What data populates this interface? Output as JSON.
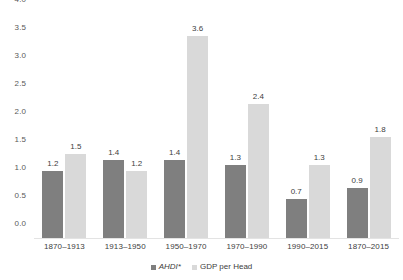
{
  "chart_data": {
    "type": "bar",
    "title": "",
    "subtitle": "",
    "xlabel": "",
    "ylabel": "",
    "ylim": [
      0.0,
      4.0
    ],
    "ytick_step": 0.5,
    "yticks": [
      "0.0",
      "0.5",
      "1.0",
      "1.5",
      "2.0",
      "2.5",
      "3.0",
      "3.5",
      "4.0"
    ],
    "grid": false,
    "legend_position": "bottom-center",
    "categories": [
      "1870–1913",
      "1913–1950",
      "1950–1970",
      "1970–1990",
      "1990–2015",
      "1870–2015"
    ],
    "series": [
      {
        "name": "AHDI*",
        "color": "#7f7f7f",
        "italic": true,
        "values": [
          1.2,
          1.4,
          1.4,
          1.3,
          0.7,
          0.9
        ],
        "labels": [
          "1.2",
          "1.4",
          "1.4",
          "1.3",
          "0.7",
          "0.9"
        ]
      },
      {
        "name": "GDP per Head",
        "color": "#d9d9d9",
        "italic": false,
        "values": [
          1.5,
          1.2,
          3.6,
          2.4,
          1.3,
          1.8
        ],
        "labels": [
          "1.5",
          "1.2",
          "3.6",
          "2.4",
          "1.3",
          "1.8"
        ]
      }
    ]
  },
  "axis": {
    "y_tick_labels": [
      "4.0",
      "3.5",
      "3.0",
      "2.5",
      "2.0",
      "1.5",
      "1.0",
      "0.5",
      "0.0"
    ]
  },
  "legend": {
    "items": [
      {
        "label": "AHDI*",
        "color": "#7f7f7f"
      },
      {
        "label": "GDP per Head",
        "color": "#d9d9d9"
      }
    ]
  },
  "colors": {
    "series1": "#7f7f7f",
    "series2": "#d9d9d9",
    "text": "#404040",
    "axis_text": "#595959",
    "background": "#ffffff",
    "baseline": "#e3e3e3"
  }
}
